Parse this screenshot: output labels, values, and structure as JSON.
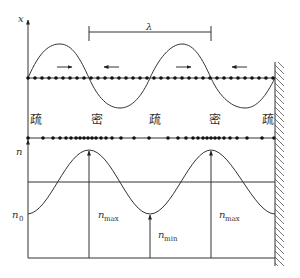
{
  "diagram": {
    "top_panel": {
      "axis_label": "x",
      "wavelength_label": "λ",
      "region_labels": [
        "疏",
        "密",
        "疏",
        "密",
        "疏"
      ],
      "motion_arrows": [
        "right",
        "left",
        "right",
        "left"
      ]
    },
    "bottom_panel": {
      "axis_label": "n",
      "baseline_label": "n",
      "baseline_sub": "0",
      "labels": [
        {
          "main": "n",
          "sub": "max"
        },
        {
          "main": "n",
          "sub": "min"
        },
        {
          "main": "n",
          "sub": "max"
        }
      ]
    },
    "colors": {
      "line": "#333333",
      "background": "#ffffff"
    }
  }
}
